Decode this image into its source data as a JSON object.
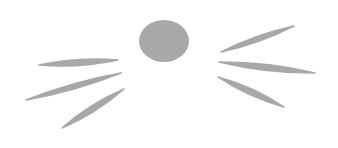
{
  "illustration": {
    "subject": "cat nose with whiskers",
    "background": "#ffffff",
    "stroke_color": "#a8a8a8",
    "nose": {
      "cx": 164,
      "cy": 41,
      "rx": 25,
      "ry": 21
    },
    "whiskers_left": [
      {
        "x1": 39,
        "y1": 65,
        "x2": 118,
        "y2": 60,
        "width": 6
      },
      {
        "x1": 26,
        "y1": 100,
        "x2": 121,
        "y2": 73,
        "width": 5
      },
      {
        "x1": 62,
        "y1": 128,
        "x2": 124,
        "y2": 89,
        "width": 6
      }
    ],
    "whiskers_right": [
      {
        "x1": 221,
        "y1": 52,
        "x2": 294,
        "y2": 26,
        "width": 5
      },
      {
        "x1": 219,
        "y1": 62,
        "x2": 315,
        "y2": 73,
        "width": 6
      },
      {
        "x1": 218,
        "y1": 77,
        "x2": 284,
        "y2": 107,
        "width": 6
      }
    ]
  }
}
